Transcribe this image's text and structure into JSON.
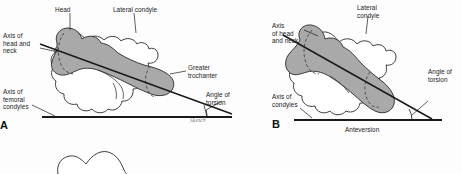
{
  "figure": {
    "background_color": "#fdfdfd",
    "bone_fill_color": "#a9a9a9",
    "bone_outline_color": "#2a2a2a",
    "axis_line_color": "#1a1a1a",
    "label_text_color": "#1a1a1a"
  },
  "panel_a": {
    "letter": "A",
    "labels": {
      "head": "Head",
      "lateral_condyle": "Lateral condyle",
      "axis_head_neck": "Axis of\nhead and\nneck",
      "axis_femoral_condyles": "Axis of\nfemoral\ncondyles",
      "greater_trochanter": "Greater\ntrochanter",
      "angle_of_torsion": "Angle of\ntorsion"
    },
    "signature": "Sketch"
  },
  "panel_b": {
    "letter": "B",
    "labels": {
      "lateral_condyle": "Lateral\ncondyle",
      "axis_head_neck": "Axis\nof head\nand neck",
      "axis_condyles": "Axis of\ncondyles",
      "angle_of_torsion": "Angle of\ntorsion",
      "caption": "Anteversion"
    }
  }
}
